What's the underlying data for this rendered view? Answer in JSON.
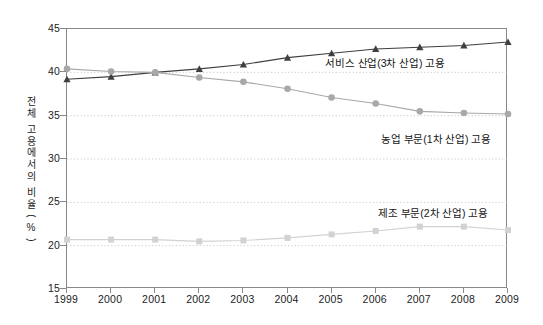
{
  "chart_data": {
    "type": "line",
    "title": "",
    "xlabel": "",
    "ylabel": "전체 고용에서의 비율(%)",
    "categories": [
      "1999",
      "2000",
      "2001",
      "2002",
      "2003",
      "2004",
      "2005",
      "2006",
      "2007",
      "2008",
      "2009"
    ],
    "xlim": [
      1999,
      2009
    ],
    "ylim": [
      15,
      45
    ],
    "yticks": [
      15,
      20,
      25,
      30,
      35,
      40,
      45
    ],
    "grid": true,
    "legend_position": "inline-annotations",
    "series": [
      {
        "name": "서비스 산업(3차 산업) 고용",
        "marker": "triangle",
        "color": "#3f3f3f",
        "values": [
          39.2,
          39.5,
          40.0,
          40.4,
          40.9,
          41.7,
          42.2,
          42.7,
          42.9,
          43.1,
          43.5
        ]
      },
      {
        "name": "농업 부문(1차 산업) 고용",
        "marker": "circle",
        "color": "#a8a8a8",
        "values": [
          40.4,
          40.1,
          40.0,
          39.4,
          38.9,
          38.1,
          37.1,
          36.4,
          35.5,
          35.3,
          35.2
        ]
      },
      {
        "name": "제조 부문(2차 산업) 고용",
        "marker": "square",
        "color": "#d2d2d2",
        "values": [
          20.7,
          20.7,
          20.7,
          20.5,
          20.6,
          20.9,
          21.3,
          21.7,
          22.2,
          22.2,
          21.8
        ]
      }
    ],
    "annotations": [
      {
        "text": "서비스 산업(3차 산업) 고용",
        "target": "서비스 산업(3차 산업) 고용"
      },
      {
        "text": "농업 부문(1차 산업) 고용",
        "target": "농업 부문(1차 산업) 고용"
      },
      {
        "text": "제조 부문(2차 산업) 고용",
        "target": "제조 부문(2차 산업) 고용"
      }
    ],
    "colors": {
      "services": "#3f3f3f",
      "agriculture": "#a8a8a8",
      "manufacturing": "#d2d2d2",
      "axis": "#888888",
      "grid": "#c9c9c9",
      "background": "#ffffff"
    }
  }
}
